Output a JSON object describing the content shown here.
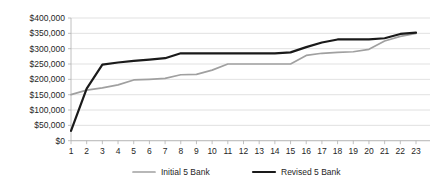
{
  "chart_data": {
    "type": "line",
    "title": "",
    "subtitle": "",
    "xlabel": "",
    "ylabel": "",
    "grid": true,
    "legend_position": "bottom",
    "ylim": [
      0,
      400000
    ],
    "ytick_labels": [
      "$400,000",
      "$350,000",
      "$300,000",
      "$250,000",
      "$200,000",
      "$150,000",
      "$100,000",
      "$50,000",
      "$0"
    ],
    "ytick_values": [
      400000,
      350000,
      300000,
      250000,
      200000,
      150000,
      100000,
      50000,
      0
    ],
    "categories": [
      "1",
      "2",
      "3",
      "4",
      "5",
      "6",
      "7",
      "8",
      "9",
      "10",
      "11",
      "12",
      "13",
      "14",
      "15",
      "16",
      "17",
      "18",
      "19",
      "20",
      "21",
      "22",
      "23"
    ],
    "x": [
      1,
      2,
      3,
      4,
      5,
      6,
      7,
      8,
      9,
      10,
      11,
      12,
      13,
      14,
      15,
      16,
      17,
      18,
      19,
      20,
      21,
      22,
      23
    ],
    "series": [
      {
        "name": "Initial  5 Bank",
        "color": "#a0a0a0",
        "values": [
          150000,
          165000,
          172000,
          182000,
          198000,
          200000,
          203000,
          215000,
          216000,
          230000,
          250000,
          250000,
          250000,
          250000,
          250000,
          278000,
          285000,
          288000,
          290000,
          298000,
          325000,
          340000,
          350000
        ]
      },
      {
        "name": "Revised 5 Bank",
        "color": "#1a1a1a",
        "values": [
          32000,
          170000,
          248000,
          255000,
          260000,
          264000,
          269000,
          285000,
          285000,
          285000,
          285000,
          285000,
          285000,
          285000,
          288000,
          305000,
          320000,
          330000,
          330000,
          330000,
          334000,
          348000,
          352000
        ]
      }
    ]
  },
  "legend": {
    "items": [
      {
        "label": "Initial  5 Bank",
        "color": "#a0a0a0"
      },
      {
        "label": "Revised 5 Bank",
        "color": "#1a1a1a"
      }
    ]
  }
}
